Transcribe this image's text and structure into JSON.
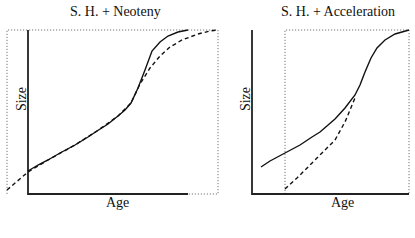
{
  "figure": {
    "panels": [
      {
        "title": "S. H. + Neoteny",
        "xlabel": "Age",
        "ylabel": "Size",
        "solid_curve": "M28,171 L38,165 L48,160 L60,153 L75,145 L88,137 L97,131 L108,124 L118,116 L125,110 L131,103 L138,88 L145,70 L152,51 L160,42 L168,36 L178,32 L188,30",
        "dashed_curve": "M7,190 L28,172 L48,160 L75,145 L97,131 L118,116 L131,103 L140,84 L150,68 L160,56 L170,47 L182,40 L198,34 L210,31 L218,30",
        "axes_solid": "M28,30 L28,194 L188,194",
        "frame_dotted": "M7,194 L7,30 L218,30 L218,194 L188,194"
      },
      {
        "title": "S. H. + Acceleration",
        "xlabel": "Age",
        "ylabel": "Size",
        "solid_curve": "M261,167 L270,161 L285,153 L300,145 L312,137 L320,132 L335,119 L345,108 L355,95 L360,85 L365,72 L371,58 L377,48 L385,40 L395,34 L409,30",
        "dashed_curve": "M285,189 L297,178 L310,165 L322,153 L335,140 L345,122 L355,98",
        "axes_solid": "M252,30 L252,194 L409,194",
        "frame_dotted": "M285,194 L285,30 L409,30 L409,194"
      }
    ]
  },
  "colors": {
    "ink": "#111111",
    "dotted_frame": "#777777",
    "background": "#ffffff"
  }
}
